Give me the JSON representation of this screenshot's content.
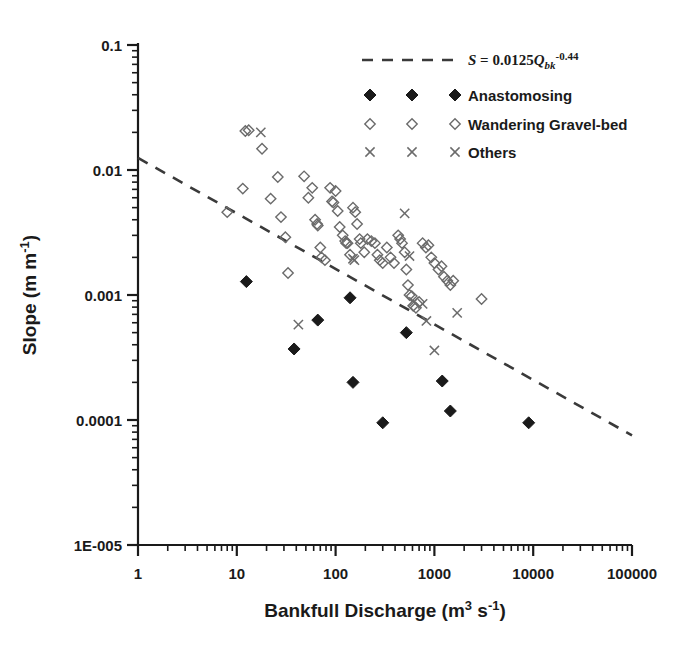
{
  "figure": {
    "background": "#ffffff",
    "foreground": "#1a1a1a",
    "open_marker_color": "#6b6b6b",
    "filled_marker_color": "#1a1a1a",
    "trend_color": "#3a3a3a"
  },
  "chart_data": {
    "type": "scatter",
    "title": "",
    "xlabel": "Bankfull Discharge (m3 s-1)",
    "xlabel_parts": {
      "base": "Bankfull Discharge (m",
      "sup1": "3",
      "mid": " s",
      "sup2": "-1",
      "tail": ")"
    },
    "ylabel": "Slope (m m-1)",
    "ylabel_parts": {
      "base": "Slope (m m",
      "sup": "-1",
      "tail": ")"
    },
    "xscale": "log",
    "yscale": "log",
    "xlim": [
      1,
      100000
    ],
    "ylim": [
      1e-05,
      0.1
    ],
    "grid": false,
    "xticks": [
      1,
      10,
      100,
      1000,
      10000,
      100000
    ],
    "xticklabels": [
      "1",
      "10",
      "100",
      "1000",
      "10000",
      "100000"
    ],
    "yticks": [
      1e-05,
      0.0001,
      0.001,
      0.01,
      0.1
    ],
    "yticklabels": [
      "1E-005",
      "0.0001",
      "0.001",
      "0.01",
      "0.1"
    ],
    "minor_ticks": true,
    "legend_position": "upper right",
    "annotation": "S = 0.0125Qbk-0.44",
    "trendline": {
      "label": "S = 0.0125Qbk-0.44",
      "equation_parts": {
        "s": "S",
        "eq": " = 0.0125",
        "q": "Q",
        "sub": "bk",
        "exp": "-0.44"
      },
      "coefficient": 0.0125,
      "exponent": -0.44,
      "style": "dashed",
      "x_start": 1,
      "x_end": 100000,
      "y_start": 0.0125,
      "y_end": 7.53e-05
    },
    "series": [
      {
        "name": "Anastomosing",
        "marker": "filled-diamond",
        "color": "#1a1a1a",
        "points": [
          [
            12.5,
            0.00128
          ],
          [
            38,
            0.00037
          ],
          [
            66,
            0.00063
          ],
          [
            140,
            0.00095
          ],
          [
            150,
            0.0002
          ],
          [
            300,
            9.5e-05
          ],
          [
            520,
            0.0005
          ],
          [
            1200,
            0.000205
          ],
          [
            1450,
            0.000118
          ],
          [
            9000,
            9.5e-05
          ]
        ]
      },
      {
        "name": "Wandering Gravel-bed",
        "marker": "open-diamond",
        "color": "#6b6b6b",
        "points": [
          [
            12.2,
            0.0205
          ],
          [
            13.2,
            0.0208
          ],
          [
            8.0,
            0.0046
          ],
          [
            11.5,
            0.0071
          ],
          [
            18.0,
            0.0148
          ],
          [
            22.0,
            0.0059
          ],
          [
            26.0,
            0.0088
          ],
          [
            28.0,
            0.0042
          ],
          [
            31.0,
            0.0029
          ],
          [
            33.0,
            0.0015
          ],
          [
            48.0,
            0.0089
          ],
          [
            53.0,
            0.006
          ],
          [
            58.0,
            0.0072
          ],
          [
            62.0,
            0.004
          ],
          [
            65.0,
            0.0037
          ],
          [
            66.0,
            0.0036
          ],
          [
            70.0,
            0.0024
          ],
          [
            72.0,
            0.002
          ],
          [
            78.0,
            0.0019
          ],
          [
            88.0,
            0.0072
          ],
          [
            92.0,
            0.0056
          ],
          [
            95.0,
            0.0055
          ],
          [
            100.0,
            0.0068
          ],
          [
            105.0,
            0.0047
          ],
          [
            110.0,
            0.0035
          ],
          [
            118.0,
            0.003
          ],
          [
            125.0,
            0.0027
          ],
          [
            128.0,
            0.0026
          ],
          [
            132.0,
            0.0026
          ],
          [
            140.0,
            0.0021
          ],
          [
            150.0,
            0.005
          ],
          [
            158.0,
            0.0046
          ],
          [
            165.0,
            0.0037
          ],
          [
            175.0,
            0.0028
          ],
          [
            180.0,
            0.0026
          ],
          [
            195.0,
            0.0022
          ],
          [
            210.0,
            0.0028
          ],
          [
            230.0,
            0.0027
          ],
          [
            250.0,
            0.0026
          ],
          [
            265.0,
            0.0021
          ],
          [
            280.0,
            0.0019
          ],
          [
            300.0,
            0.0018
          ],
          [
            330.0,
            0.0024
          ],
          [
            360.0,
            0.002
          ],
          [
            390.0,
            0.0018
          ],
          [
            430.0,
            0.003
          ],
          [
            450.0,
            0.0028
          ],
          [
            470.0,
            0.0026
          ],
          [
            500.0,
            0.0022
          ],
          [
            520.0,
            0.0016
          ],
          [
            540.0,
            0.0012
          ],
          [
            560.0,
            0.001
          ],
          [
            590.0,
            0.00098
          ],
          [
            610.0,
            0.00082
          ],
          [
            650.0,
            0.00079
          ],
          [
            700.0,
            0.00088
          ],
          [
            760.0,
            0.0026
          ],
          [
            820.0,
            0.0024
          ],
          [
            870.0,
            0.0025
          ],
          [
            930.0,
            0.002
          ],
          [
            1000.0,
            0.0018
          ],
          [
            1100.0,
            0.0016
          ],
          [
            1180.0,
            0.0017
          ],
          [
            1250.0,
            0.0014
          ],
          [
            1350.0,
            0.0013
          ],
          [
            1450.0,
            0.0012
          ],
          [
            1550.0,
            0.0013
          ],
          [
            3000.0,
            0.00093
          ]
        ]
      },
      {
        "name": "Others",
        "marker": "cross",
        "color": "#6b6b6b",
        "points": [
          [
            17.5,
            0.02
          ],
          [
            42.0,
            0.00058
          ],
          [
            150.0,
            0.00195
          ],
          [
            155.0,
            0.0019
          ],
          [
            500.0,
            0.0045
          ],
          [
            560.0,
            0.00205
          ],
          [
            620.0,
            0.00088
          ],
          [
            760.0,
            0.00085
          ],
          [
            830.0,
            0.00062
          ],
          [
            1000.0,
            0.00036
          ],
          [
            1700.0,
            0.00072
          ]
        ]
      }
    ]
  },
  "legend": {
    "items": [
      {
        "label": "S = 0.0125Qbk-0.44",
        "marker": "dashed-line"
      },
      {
        "label": "Anastomosing",
        "marker": "filled-diamond"
      },
      {
        "label": "Wandering Gravel-bed",
        "marker": "open-diamond"
      },
      {
        "label": "Others",
        "marker": "cross"
      }
    ]
  },
  "caption": {
    "text": ""
  }
}
